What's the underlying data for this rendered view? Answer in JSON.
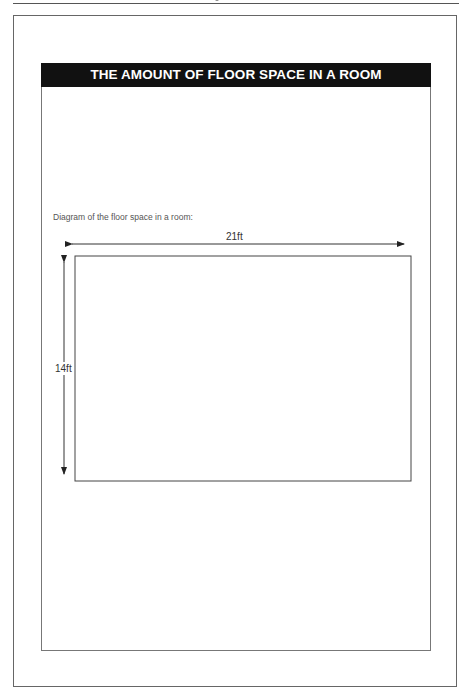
{
  "page": {
    "title": "THE AMOUNT OF FLOOR SPACE IN A ROOM",
    "caption": "Diagram of the floor space in a room:"
  },
  "diagram": {
    "shape": "rectangle",
    "width_label": "21ft",
    "height_label": "14ft",
    "width_ft": 21,
    "height_ft": 14,
    "stroke_color": "#444444",
    "header_color": "#111111"
  }
}
